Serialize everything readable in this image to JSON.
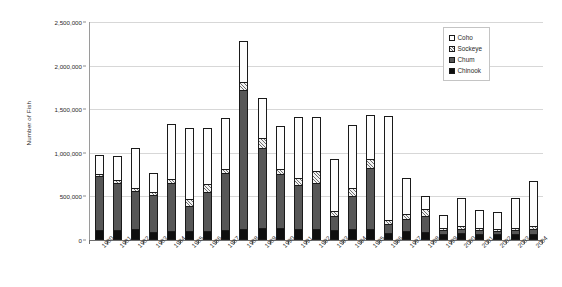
{
  "chart_data": {
    "type": "bar",
    "subtype": "stacked-vertical",
    "title": "",
    "xlabel": "",
    "ylabel": "Number of Fish",
    "ylim": [
      0,
      2500000
    ],
    "ytick_values": [
      0,
      500000,
      1000000,
      1500000,
      2000000,
      2500000
    ],
    "ytick_labels": [
      "0",
      "500,000",
      "1,000,000",
      "1,500,000",
      "2,000,000",
      "2,500,000"
    ],
    "grid": true,
    "grid_axis": "y",
    "legend_position": "top-right",
    "categories": [
      "1980",
      "1981",
      "1982",
      "1983",
      "1984",
      "1985",
      "1986",
      "1987",
      "1988",
      "1989",
      "1990",
      "1991",
      "1992",
      "1993",
      "1994",
      "1995",
      "1996",
      "1997",
      "1998",
      "1999",
      "2000",
      "2001",
      "2002",
      "2003",
      "2004"
    ],
    "series": [
      {
        "name": "Chinook",
        "color": "#0f0f0f",
        "values": [
          90000,
          95000,
          100000,
          75000,
          85000,
          80000,
          80000,
          95000,
          110000,
          120000,
          115000,
          105000,
          105000,
          95000,
          110000,
          110000,
          60000,
          80000,
          75000,
          45000,
          60000,
          55000,
          55000,
          50000,
          50000
        ]
      },
      {
        "name": "Chum",
        "color": "#575757",
        "values": [
          640000,
          555000,
          455000,
          435000,
          560000,
          290000,
          455000,
          660000,
          1605000,
          930000,
          630000,
          515000,
          540000,
          165000,
          380000,
          710000,
          105000,
          140000,
          190000,
          50000,
          50000,
          45000,
          35000,
          45000,
          55000
        ]
      },
      {
        "name": "Sockeye",
        "color": "#dcdcdc",
        "values": [
          20000,
          30000,
          35000,
          30000,
          40000,
          90000,
          90000,
          50000,
          90000,
          110000,
          55000,
          75000,
          135000,
          60000,
          95000,
          100000,
          40000,
          60000,
          80000,
          30000,
          35000,
          25000,
          25000,
          20000,
          35000
        ]
      },
      {
        "name": "Coho",
        "color": "#ffffff",
        "values": [
          225000,
          280000,
          470000,
          230000,
          640000,
          820000,
          655000,
          595000,
          475000,
          470000,
          510000,
          715000,
          630000,
          605000,
          730000,
          510000,
          1220000,
          430000,
          160000,
          160000,
          340000,
          220000,
          210000,
          370000,
          540000
        ]
      }
    ],
    "totals": [
      975000,
      960000,
      1060000,
      770000,
      1325000,
      1280000,
      1280000,
      1400000,
      2280000,
      1630000,
      1310000,
      1410000,
      1410000,
      925000,
      1315000,
      1430000,
      1425000,
      710000,
      505000,
      285000,
      485000,
      345000,
      325000,
      485000,
      680000
    ],
    "legend": [
      {
        "label": "Coho",
        "swatch": "coho"
      },
      {
        "label": "Sockeye",
        "swatch": "sockeye"
      },
      {
        "label": "Chum",
        "swatch": "chum"
      },
      {
        "label": "Chinook",
        "swatch": "chinook"
      }
    ]
  }
}
